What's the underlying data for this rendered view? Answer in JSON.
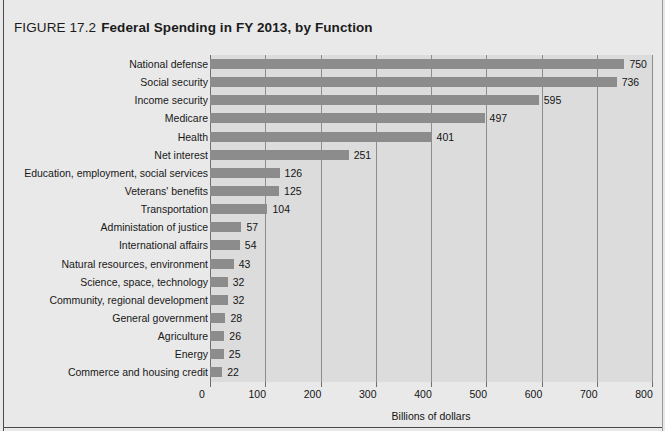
{
  "figure": {
    "label": "FIGURE 17.2",
    "title": "Federal Spending in FY 2013, by Function"
  },
  "chart_data": {
    "type": "bar",
    "orientation": "horizontal",
    "title": "Federal Spending in FY 2013, by Function",
    "xlabel": "Billions of dollars",
    "ylabel": "",
    "xlim": [
      0,
      800
    ],
    "xticks": [
      0,
      100,
      200,
      300,
      400,
      500,
      600,
      700,
      800
    ],
    "xtick_labels": [
      "0",
      "100",
      "200",
      "300",
      "400",
      "500",
      "600",
      "700",
      "800"
    ],
    "grid": "vertical",
    "legend": "none",
    "bar_color": "#8c8c8c",
    "panel_color": "#dcdcdc",
    "background_color": "#e9e9e9",
    "categories": [
      "National defense",
      "Social security",
      "Income security",
      "Medicare",
      "Health",
      "Net interest",
      "Education, employment, social services",
      "Veterans' benefits",
      "Transportation",
      "Administation of justice",
      "International affairs",
      "Natural resources, environment",
      "Science, space, technology",
      "Community, regional development",
      "General government",
      "Agriculture",
      "Energy",
      "Commerce and housing credit"
    ],
    "values": [
      750,
      736,
      595,
      497,
      401,
      251,
      126,
      125,
      104,
      57,
      54,
      43,
      32,
      32,
      28,
      26,
      25,
      22
    ],
    "value_labels": [
      "750",
      "736",
      "595",
      "497",
      "401",
      "251",
      "126",
      "125",
      "104",
      "57",
      "54",
      "43",
      "32",
      "32",
      "28",
      "26",
      "25",
      "22"
    ]
  }
}
